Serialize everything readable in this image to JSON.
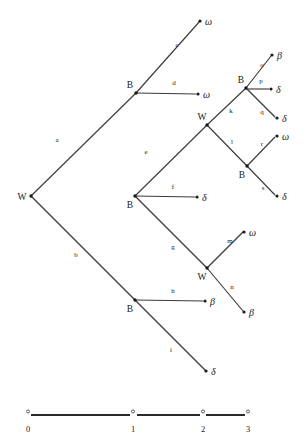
{
  "figure": {
    "title": "",
    "type": "phylogenetic-tree",
    "background_color": "#ffffff",
    "line_color": "#3a3a3a",
    "text_color": "#1a1a1a"
  },
  "chart_data": {
    "type": "tree",
    "title": "",
    "xlabel": "",
    "ylabel": "",
    "internal_nodes": [
      {
        "id": "root",
        "label": "W",
        "x": 31,
        "y": 196,
        "label_x": 22,
        "label_y": 200
      },
      {
        "id": "n_top",
        "label": "B",
        "x": 136,
        "y": 93,
        "label_x": 130,
        "label_y": 88
      },
      {
        "id": "n_mid",
        "label": "B",
        "x": 135,
        "y": 196,
        "label_x": 130,
        "label_y": 208
      },
      {
        "id": "n_w2",
        "label": "W",
        "x": 207,
        "y": 125,
        "label_x": 202,
        "label_y": 120
      },
      {
        "id": "n_br",
        "label": "B",
        "x": 246,
        "y": 88,
        "label_x": 241,
        "label_y": 83
      },
      {
        "id": "n_b2",
        "label": "B",
        "x": 247,
        "y": 166,
        "label_x": 242,
        "label_y": 178
      },
      {
        "id": "n_bot",
        "label": "B",
        "x": 135,
        "y": 300,
        "label_x": 130,
        "label_y": 312
      },
      {
        "id": "n_w3",
        "label": "W",
        "x": 207,
        "y": 268,
        "label_x": 202,
        "label_y": 280
      }
    ],
    "tips": [
      {
        "id": "t_c",
        "label": "ω",
        "x": 200,
        "y": 21,
        "label_x": 205,
        "label_y": 25
      },
      {
        "id": "t_d",
        "label": "ω",
        "x": 198,
        "y": 94,
        "label_x": 203,
        "label_y": 98
      },
      {
        "id": "t_o",
        "label": "β",
        "x": 272,
        "y": 55,
        "label_x": 277,
        "label_y": 59
      },
      {
        "id": "t_p",
        "label": "δ",
        "x": 271,
        "y": 89,
        "label_x": 276,
        "label_y": 93
      },
      {
        "id": "t_q",
        "label": "δ",
        "x": 277,
        "y": 118,
        "label_x": 282,
        "label_y": 122
      },
      {
        "id": "t_r",
        "label": "ω",
        "x": 277,
        "y": 136,
        "label_x": 282,
        "label_y": 140
      },
      {
        "id": "t_s",
        "label": "δ",
        "x": 277,
        "y": 196,
        "label_x": 282,
        "label_y": 200
      },
      {
        "id": "t_f",
        "label": "δ",
        "x": 197,
        "y": 197,
        "label_x": 202,
        "label_y": 201
      },
      {
        "id": "t_m",
        "label": "ω",
        "x": 244,
        "y": 232,
        "label_x": 249,
        "label_y": 236
      },
      {
        "id": "t_n",
        "label": "β",
        "x": 244,
        "y": 312,
        "label_x": 249,
        "label_y": 316
      },
      {
        "id": "t_h",
        "label": "β",
        "x": 205,
        "y": 301,
        "label_x": 210,
        "label_y": 305
      },
      {
        "id": "t_i",
        "label": "δ",
        "x": 206,
        "y": 371,
        "label_x": 211,
        "label_y": 375
      }
    ],
    "edges": [
      {
        "label": "a",
        "from": "root",
        "to": "n_top",
        "x1": 31,
        "y1": 196,
        "x2": 136,
        "y2": 93,
        "label_x": 57,
        "label_y": 142
      },
      {
        "label": "b",
        "from": "root",
        "to": "n_bot",
        "x1": 31,
        "y1": 196,
        "x2": 135,
        "y2": 300,
        "label_x": 76,
        "label_y": 257
      },
      {
        "label": "c",
        "from": "n_top",
        "to": "t_c",
        "x1": 136,
        "y1": 93,
        "x2": 200,
        "y2": 21,
        "label_x": 177,
        "label_y": 47
      },
      {
        "label": "d",
        "from": "n_top",
        "to": "t_d",
        "x1": 136,
        "y1": 93,
        "x2": 196,
        "y2": 94,
        "label_x": 174,
        "label_y": 85
      },
      {
        "label": "e",
        "from": "n_mid",
        "to": "n_w2",
        "x1": 135,
        "y1": 196,
        "x2": 207,
        "y2": 125,
        "label_x": 146,
        "label_y": 154
      },
      {
        "label": "f",
        "from": "n_mid",
        "to": "t_f",
        "x1": 135,
        "y1": 196,
        "x2": 195,
        "y2": 197,
        "label_x": 173,
        "label_y": 189
      },
      {
        "label": "g",
        "from": "n_mid",
        "to": "n_w3",
        "x1": 135,
        "y1": 196,
        "x2": 207,
        "y2": 268,
        "label_x": 173,
        "label_y": 249
      },
      {
        "label": "h",
        "from": "n_bot",
        "to": "t_h",
        "x1": 135,
        "y1": 300,
        "x2": 203,
        "y2": 301,
        "label_x": 173,
        "label_y": 293
      },
      {
        "label": "i",
        "from": "n_bot",
        "to": "t_i",
        "x1": 135,
        "y1": 300,
        "x2": 206,
        "y2": 371,
        "label_x": 171,
        "label_y": 352
      },
      {
        "label": "k",
        "from": "n_w2",
        "to": "n_br",
        "x1": 207,
        "y1": 125,
        "x2": 246,
        "y2": 88,
        "label_x": 231,
        "label_y": 113
      },
      {
        "label": "l",
        "from": "n_w2",
        "to": "n_b2",
        "x1": 207,
        "y1": 125,
        "x2": 247,
        "y2": 166,
        "label_x": 232,
        "label_y": 144
      },
      {
        "label": "m",
        "from": "n_w3",
        "to": "t_m",
        "x1": 207,
        "y1": 268,
        "x2": 243,
        "y2": 232,
        "label_x": 230,
        "label_y": 243
      },
      {
        "label": "n",
        "from": "n_w3",
        "to": "t_n",
        "x1": 207,
        "y1": 268,
        "x2": 243,
        "y2": 311,
        "label_x": 232,
        "label_y": 289
      },
      {
        "label": "o",
        "from": "n_br",
        "to": "t_o",
        "x1": 246,
        "y1": 88,
        "x2": 271,
        "y2": 56,
        "label_x": 262,
        "label_y": 67
      },
      {
        "label": "p",
        "from": "n_br",
        "to": "t_p",
        "x1": 248,
        "y1": 89,
        "x2": 269,
        "y2": 89,
        "label_x": 261,
        "label_y": 83
      },
      {
        "label": "q",
        "from": "n_br",
        "to": "t_q",
        "x1": 246,
        "y1": 88,
        "x2": 275,
        "y2": 117,
        "label_x": 262,
        "label_y": 114
      },
      {
        "label": "r",
        "from": "n_b2",
        "to": "t_r",
        "x1": 247,
        "y1": 166,
        "x2": 275,
        "y2": 137,
        "label_x": 262,
        "label_y": 146
      },
      {
        "label": "s",
        "from": "n_b2",
        "to": "t_s",
        "x1": 247,
        "y1": 166,
        "x2": 275,
        "y2": 195,
        "label_x": 263,
        "label_y": 190
      }
    ]
  },
  "scale_bar": {
    "y": 415,
    "label_y": 432,
    "ticks": [
      {
        "label": "0",
        "x": 28
      },
      {
        "label": "1",
        "x": 133
      },
      {
        "label": "2",
        "x": 203
      },
      {
        "label": "3",
        "x": 248
      }
    ],
    "segments": [
      {
        "x1": 31,
        "x2": 130
      },
      {
        "x1": 137,
        "x2": 200
      },
      {
        "x1": 206,
        "x2": 245
      }
    ]
  }
}
